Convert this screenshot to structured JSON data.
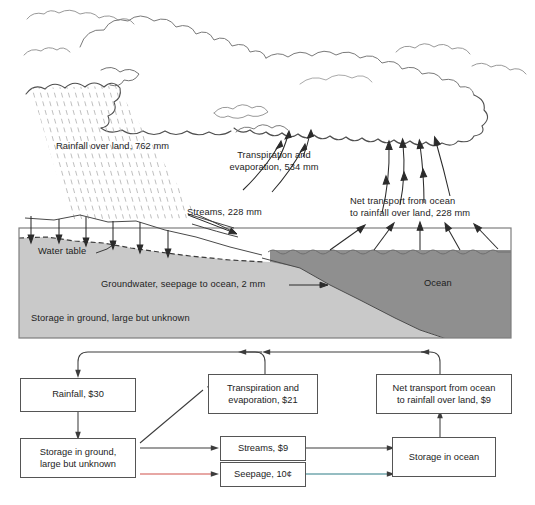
{
  "figure": {
    "colors": {
      "ground_fill": "#c9c9c9",
      "ocean_fill": "#8f8f8f",
      "outline": "#4d4d4d",
      "box_border": "#555555",
      "text": "#1d1d1d",
      "seepage_line_red": "#d0504a",
      "seepage_line_teal": "#2d7d85",
      "storage_ocean_tint": "#8fbf7f"
    }
  },
  "upper_diagram": {
    "labels": {
      "rainfall_over_land": "Rainfall over land, 762 mm",
      "transpiration_evaporation": "Transpiration and\nevaporation, 534 mm",
      "streams": "Streams, 228 mm",
      "net_transport": "Net transport from ocean\nto rainfall over land, 228 mm",
      "water_table": "Water table",
      "groundwater_seepage": "Groundwater, seepage to ocean, 2 mm",
      "storage_in_ground": "Storage in ground, large but unknown",
      "ocean": "Ocean"
    },
    "values": {
      "rainfall_over_land_mm": 762,
      "transpiration_evaporation_mm": 534,
      "streams_mm": 228,
      "net_transport_mm": 228,
      "groundwater_seepage_mm": 2
    }
  },
  "flow_diagram": {
    "boxes": [
      {
        "id": "rainfall",
        "label": "Rainfall, $30",
        "value": "$30"
      },
      {
        "id": "storage-in-ground",
        "label": "Storage in ground,\nlarge but unknown",
        "value": "large but unknown"
      },
      {
        "id": "transpiration-evaporation",
        "label": "Transpiration and\nevaporation, $21",
        "value": "$21"
      },
      {
        "id": "streams",
        "label": "Streams, $9",
        "value": "$9"
      },
      {
        "id": "seepage",
        "label": "Seepage, 10¢",
        "value": "10¢"
      },
      {
        "id": "net-transport",
        "label": "Net transport from ocean\nto rainfall over land, $9",
        "value": "$9"
      },
      {
        "id": "storage-in-ocean",
        "label": "Storage in ocean",
        "value": ""
      }
    ]
  }
}
